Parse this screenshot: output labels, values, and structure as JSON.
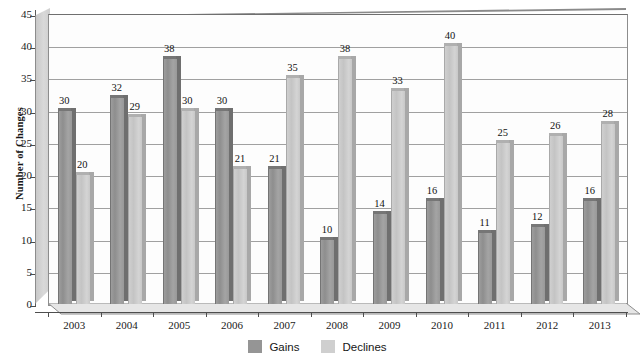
{
  "chart_data": {
    "type": "bar",
    "title": "",
    "xlabel": "",
    "ylabel": "Number of Changes",
    "ylim": [
      0,
      45
    ],
    "ytick_step": 5,
    "yticks": [
      45,
      40,
      35,
      30,
      25,
      20,
      15,
      10,
      5,
      0
    ],
    "grid": true,
    "legend_position": "bottom",
    "style_3d": true,
    "categories": [
      "2003",
      "2004",
      "2005",
      "2006",
      "2007",
      "2008",
      "2009",
      "2010",
      "2011",
      "2012",
      "2013"
    ],
    "series": [
      {
        "name": "Gains",
        "color": "#959595",
        "values": [
          30,
          32,
          38,
          30,
          21,
          10,
          14,
          16,
          11,
          12,
          16
        ]
      },
      {
        "name": "Declines",
        "color": "#cfcfcf",
        "values": [
          20,
          29,
          30,
          21,
          35,
          38,
          33,
          40,
          25,
          26,
          28
        ]
      }
    ]
  },
  "legend": {
    "items": [
      {
        "label": "Gains",
        "swatch": "gains"
      },
      {
        "label": "Declines",
        "swatch": "declines"
      }
    ]
  }
}
